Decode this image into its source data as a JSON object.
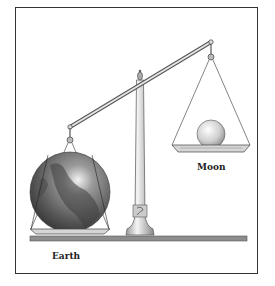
{
  "figure": {
    "labels": {
      "earth": "Earth",
      "moon": "Moon"
    },
    "colors": {
      "frame": "#333333",
      "earth_dark": "#3a3a3a",
      "earth_light": "#e8e8e8",
      "metal": "#888888",
      "base": "#8a8a8a"
    }
  }
}
